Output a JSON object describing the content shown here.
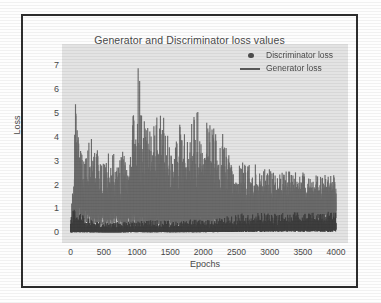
{
  "chart_data": {
    "type": "line",
    "title": "Generator and Discriminator loss values",
    "xlabel": "Epochs",
    "ylabel": "Loss",
    "xlim": [
      -130,
      4180
    ],
    "ylim": [
      -0.45,
      7.9
    ],
    "xticks": [
      "0",
      "500",
      "1000",
      "1500",
      "2000",
      "2500",
      "3000",
      "3500",
      "4000"
    ],
    "xtick_values": [
      0,
      500,
      1000,
      1500,
      2000,
      2500,
      3000,
      3500,
      4000
    ],
    "yticks": [
      "0",
      "1",
      "2",
      "3",
      "4",
      "5",
      "6",
      "7"
    ],
    "ytick_values": [
      0,
      1,
      2,
      3,
      4,
      5,
      6,
      7
    ],
    "grid": false,
    "legend_position": "upper right",
    "plot_background": "#e3e3e3",
    "series": [
      {
        "name": "Discriminator loss",
        "marker": "dot",
        "color": "#3f3f3f",
        "x": [
          0,
          80,
          150,
          250,
          400,
          600,
          800,
          1000,
          1200,
          1400,
          1600,
          1800,
          2000,
          2200,
          2400,
          2600,
          2800,
          3000,
          3200,
          3400,
          3600,
          3800,
          4000
        ],
        "band_low": [
          0.0,
          0.02,
          0.02,
          0.01,
          0.01,
          0.0,
          0.01,
          0.02,
          0.01,
          0.02,
          0.01,
          0.02,
          0.02,
          0.03,
          0.05,
          0.08,
          0.1,
          0.1,
          0.11,
          0.12,
          0.12,
          0.13,
          0.13
        ],
        "band_high": [
          0.95,
          1.0,
          0.88,
          0.6,
          0.45,
          0.42,
          0.48,
          0.45,
          0.52,
          0.5,
          0.47,
          0.55,
          0.52,
          0.58,
          0.7,
          0.8,
          0.82,
          0.8,
          0.82,
          0.84,
          0.83,
          0.85,
          0.9
        ],
        "peak": 1.05,
        "mean": 0.35
      },
      {
        "name": "Generator loss",
        "marker": "line",
        "color": "#6b6b6b",
        "x": [
          0,
          60,
          80,
          120,
          200,
          300,
          420,
          520,
          650,
          780,
          900,
          1020,
          1060,
          1150,
          1280,
          1350,
          1460,
          1560,
          1680,
          1780,
          1880,
          1960,
          2060,
          2180,
          2280,
          2400,
          2520,
          2650,
          2780,
          2900,
          3020,
          3150,
          3280,
          3400,
          3520,
          3650,
          3780,
          3900,
          4000
        ],
        "band_low": [
          0.05,
          0.1,
          1.2,
          1.6,
          1.1,
          1.0,
          0.95,
          0.9,
          0.85,
          0.8,
          0.75,
          0.8,
          0.8,
          0.75,
          0.8,
          0.78,
          0.75,
          0.7,
          0.72,
          0.7,
          0.68,
          0.7,
          0.72,
          0.75,
          0.78,
          0.8,
          0.85,
          0.88,
          0.9,
          0.92,
          0.95,
          0.95,
          0.98,
          1.0,
          1.0,
          1.02,
          1.05,
          1.05,
          1.0
        ],
        "band_high": [
          0.2,
          4.2,
          6.55,
          4.0,
          3.2,
          4.1,
          3.4,
          3.2,
          3.6,
          3.4,
          3.5,
          7.6,
          5.3,
          4.6,
          4.8,
          5.2,
          4.4,
          3.8,
          5.05,
          3.9,
          5.75,
          4.3,
          5.15,
          4.2,
          4.3,
          3.1,
          2.9,
          3.0,
          2.85,
          2.75,
          2.7,
          2.65,
          2.6,
          2.55,
          2.5,
          2.55,
          2.45,
          2.5,
          2.45
        ],
        "max_peak": 7.6,
        "max_peak_epoch": 1020,
        "secondary_peak": 6.55,
        "secondary_peak_epoch": 80
      }
    ]
  },
  "legend": {
    "items": [
      {
        "label": "Discriminator loss",
        "marker": "dot"
      },
      {
        "label": "Generator loss",
        "marker": "line"
      }
    ]
  }
}
